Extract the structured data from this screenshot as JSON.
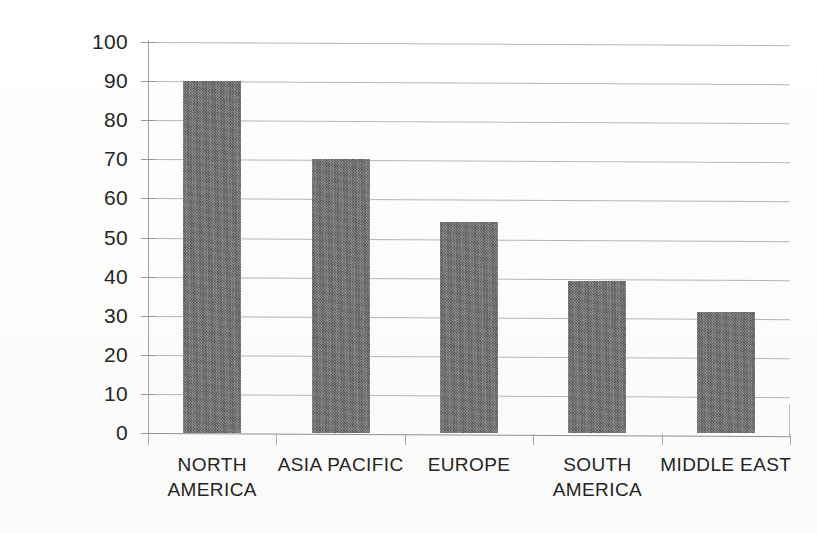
{
  "chart_data": {
    "type": "bar",
    "title": "",
    "subtitle": "",
    "xlabel": "",
    "ylabel": "",
    "categories": [
      "NORTH AMERICA",
      "ASIA PACIFIC",
      "EUROPE",
      "SOUTH AMERICA",
      "MIDDLE EAST"
    ],
    "category_labels_wrapped": [
      "NORTH\nAMERICA",
      "ASIA PACIFIC",
      "EUROPE",
      "SOUTH\nAMERICA",
      "MIDDLE EAST"
    ],
    "values": [
      90,
      70,
      54,
      39,
      31
    ],
    "ylim": [
      0,
      100
    ],
    "ytick_step": 10,
    "ytick_labels": [
      "100",
      "90",
      "80",
      "70",
      "60",
      "50",
      "40",
      "30",
      "20",
      "10",
      "0"
    ],
    "ytick_values": [
      100,
      90,
      80,
      70,
      60,
      50,
      40,
      30,
      20,
      10,
      0
    ],
    "grid": true,
    "grid_axis": "y",
    "legend": false,
    "legend_position": "none",
    "bar_color": "#6e6e6e",
    "gridline_color": "#9a9a9a",
    "axis_color": "#8f8f8f",
    "text_color": "#262626",
    "background_color": "#fdfdfc"
  }
}
